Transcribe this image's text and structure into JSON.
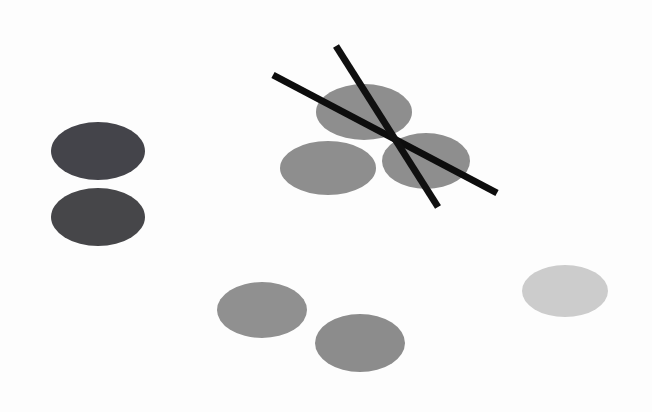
{
  "scene": {
    "title": "Abstract scene of gray ellipses and two crossed black sticks on a white background",
    "width": 652,
    "height": 412,
    "background_color": "#fdfdfd",
    "description": "Nine flat gray ellipses of three tonal groups scattered on a white surface, with two thin black rod shapes forming an X over the upper-middle cluster."
  },
  "palette": {
    "background": "#fdfdfd",
    "dark_gray": "#44444a",
    "mid_gray": "#8e8e8e",
    "mid_gray_alt": "#909090",
    "light_gray": "#cccccc",
    "stick_black": "#0d0d0d"
  },
  "groups": [
    {
      "name": "left-dark-pair",
      "label": "Dark gray pair, left side",
      "count": 2,
      "color": "#44444a",
      "tone": "dark"
    },
    {
      "name": "upper-cluster",
      "label": "Mid gray cluster, upper middle, overlaid by sticks",
      "count": 3,
      "color": "#8e8e8e",
      "tone": "medium"
    },
    {
      "name": "lower-pair",
      "label": "Mid gray pair, lower middle",
      "count": 2,
      "color": "#909090",
      "tone": "medium"
    },
    {
      "name": "right-light-single",
      "label": "Light gray single, right side",
      "count": 1,
      "color": "#cccccc",
      "tone": "light"
    }
  ],
  "ellipses": [
    {
      "id": "ellipse-dark-upper-left",
      "group": "left-dark-pair",
      "cx": 98,
      "cy": 151,
      "rx": 47,
      "ry": 29,
      "rotation": 0,
      "fill": "#44444a"
    },
    {
      "id": "ellipse-dark-lower-left",
      "group": "left-dark-pair",
      "cx": 98,
      "cy": 217,
      "rx": 47,
      "ry": 29,
      "rotation": 0,
      "fill": "#464649"
    },
    {
      "id": "ellipse-cluster-top",
      "group": "upper-cluster",
      "cx": 364,
      "cy": 112,
      "rx": 48,
      "ry": 28,
      "rotation": 0,
      "fill": "#8e8e8e"
    },
    {
      "id": "ellipse-cluster-left",
      "group": "upper-cluster",
      "cx": 328,
      "cy": 168,
      "rx": 48,
      "ry": 27,
      "rotation": 0,
      "fill": "#8e8e8e"
    },
    {
      "id": "ellipse-cluster-right",
      "group": "upper-cluster",
      "cx": 426,
      "cy": 161,
      "rx": 44,
      "ry": 28,
      "rotation": 0,
      "fill": "#8e8e8e"
    },
    {
      "id": "ellipse-lower-left",
      "group": "lower-pair",
      "cx": 262,
      "cy": 310,
      "rx": 45,
      "ry": 28,
      "rotation": 0,
      "fill": "#909090"
    },
    {
      "id": "ellipse-lower-right",
      "group": "lower-pair",
      "cx": 360,
      "cy": 343,
      "rx": 45,
      "ry": 29,
      "rotation": 0,
      "fill": "#8c8c8c"
    },
    {
      "id": "ellipse-right-light",
      "group": "right-light-single",
      "cx": 565,
      "cy": 291,
      "rx": 43,
      "ry": 26,
      "rotation": 0,
      "fill": "#cccccc"
    }
  ],
  "sticks": [
    {
      "id": "stick-upper-left-to-lower-right",
      "label": "Stick running from upper-left down to lower-right",
      "x1": 273,
      "y1": 75,
      "x2": 497,
      "y2": 193,
      "thickness": 7,
      "color": "#0d0d0d"
    },
    {
      "id": "stick-upper-right-to-lower-left",
      "label": "Stick running from upper area down-left to lower-left",
      "x1": 336,
      "y1": 46,
      "x2": 438,
      "y2": 207,
      "thickness": 7,
      "color": "#101010"
    }
  ],
  "crossing_point": {
    "label": "Sticks cross",
    "x": 397,
    "y": 137
  }
}
